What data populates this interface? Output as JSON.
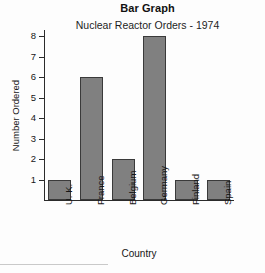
{
  "chart_data": {
    "type": "bar",
    "title": "Bar Graph",
    "subtitle": "Nuclear Reactor Orders - 1974",
    "xlabel": "Country",
    "ylabel": "Number Ordered",
    "categories": [
      "U. K.",
      "France",
      "Belgium",
      "Germany",
      "Finland",
      "Spain"
    ],
    "values": [
      1,
      6,
      2,
      8,
      1,
      1
    ],
    "ylim": [
      0,
      8
    ],
    "yticks": [
      1,
      2,
      3,
      4,
      5,
      6,
      7,
      8
    ],
    "ytick_labels": [
      "1",
      "2",
      "3",
      "4",
      "5",
      "6",
      "7",
      "8"
    ],
    "grid": false,
    "legend": false,
    "bar_color": "#808080",
    "bar_edge_color": "#3a3a3a",
    "axis_color": "#2b2b2b",
    "background_color": "#fdfdfd"
  }
}
